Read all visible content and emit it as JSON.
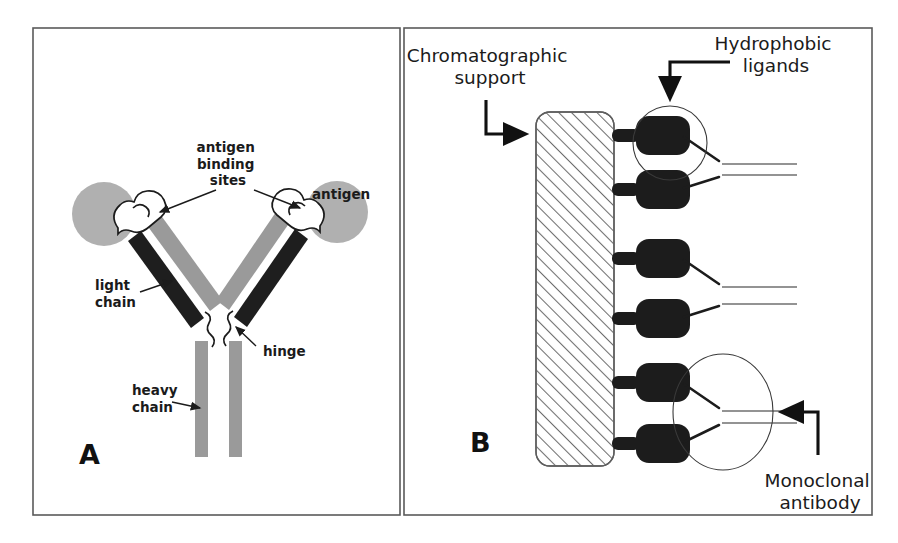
{
  "figure": {
    "background_color": "#ffffff",
    "panels": [
      {
        "id": "A",
        "letter": "A",
        "title_hidden": "Antibody structure schematic",
        "frame": {
          "x": 33,
          "y": 28,
          "width": 367,
          "height": 487,
          "stroke": "#5a5a5a"
        },
        "labels": [
          {
            "name": "antigen-binding-sites",
            "lines": [
              "antigen",
              "binding",
              "sites"
            ],
            "x": 228,
            "y": 152
          },
          {
            "name": "antigen",
            "lines": [
              "antigen"
            ],
            "x": 312,
            "y": 199
          },
          {
            "name": "light-chain",
            "lines": [
              "light",
              "chain"
            ],
            "x": 95,
            "y": 290
          },
          {
            "name": "heavy-chain",
            "lines": [
              "heavy",
              "chain"
            ],
            "x": 132,
            "y": 395
          },
          {
            "name": "hinge",
            "lines": [
              "hinge"
            ],
            "x": 263,
            "y": 352
          }
        ],
        "letter_pos": {
          "x": 79,
          "y": 464
        },
        "colors": {
          "heavy_chain": "#9a9a9a",
          "light_chain": "#1e1e1e",
          "antigen": "#b0b0b0"
        }
      },
      {
        "id": "B",
        "letter": "B",
        "title_hidden": "Hydrophobic interaction chromatography schematic",
        "frame": {
          "x": 404,
          "y": 28,
          "width": 468,
          "height": 487,
          "stroke": "#5a5a5a"
        },
        "labels": [
          {
            "name": "chromatographic-support",
            "lines": [
              "Chromatographic",
              "support"
            ],
            "x": 490,
            "y": 62
          },
          {
            "name": "hydrophobic-ligands",
            "lines": [
              "Hydrophobic",
              "ligands"
            ],
            "x": 776,
            "y": 50
          },
          {
            "name": "monoclonal-antibody",
            "lines": [
              "Monoclonal",
              "antibody"
            ],
            "x": 820,
            "y": 487
          }
        ],
        "letter_pos": {
          "x": 470,
          "y": 452
        },
        "support": {
          "x": 536,
          "y": 112,
          "width": 78,
          "height": 354,
          "radius": 14,
          "hatch_color": "#6e6e6e"
        },
        "ligand_count": 6,
        "ligand_y_positions": [
          135,
          189,
          258,
          318,
          382,
          443
        ],
        "highlight_regions": [
          {
            "name": "hydrophobic-ligand-highlight",
            "shape": "circle",
            "cx": 670,
            "cy": 143,
            "rx": 37,
            "ry": 37
          },
          {
            "name": "monoclonal-antibody-highlight",
            "shape": "ellipse",
            "cx": 723,
            "cy": 412,
            "rx": 50,
            "ry": 58
          }
        ],
        "colors": {
          "ligand": "#1c1c1c",
          "antibody_arm": "#1c1c1c",
          "antibody_tail": "#6f6f6f"
        }
      }
    ]
  }
}
